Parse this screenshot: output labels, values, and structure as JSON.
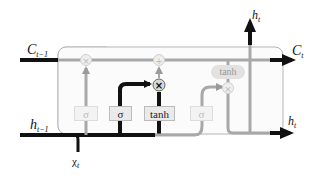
{
  "diagram": {
    "type": "LSTM cell (output gate highlighted)",
    "labels": {
      "c_prev": "C",
      "c_prev_sub": "t−1",
      "c_next": "C",
      "c_next_sub": "t",
      "h_prev": "h",
      "h_prev_sub": "t−1",
      "h_out_top": "h",
      "h_out_top_sub": "t",
      "h_out_right": "h",
      "h_out_right_sub": "t",
      "x_in": "χ",
      "x_in_sub": "t"
    },
    "gates": [
      {
        "id": "forget",
        "label": "σ",
        "active": false
      },
      {
        "id": "input",
        "label": "σ",
        "active": true
      },
      {
        "id": "candidate",
        "label": "tanh",
        "active": true
      },
      {
        "id": "output",
        "label": "σ",
        "active": false
      }
    ],
    "ops": {
      "forget_mul": "×",
      "cell_add": "+",
      "input_mul": "×",
      "output_mul": "×",
      "cell_tanh": "tanh"
    },
    "colors": {
      "active": "#111111",
      "inactive": "#9a9a9a",
      "faded": "#cccccc",
      "cell_border": "#b5b5b5",
      "cell_bg": "#fbfbfb"
    }
  }
}
